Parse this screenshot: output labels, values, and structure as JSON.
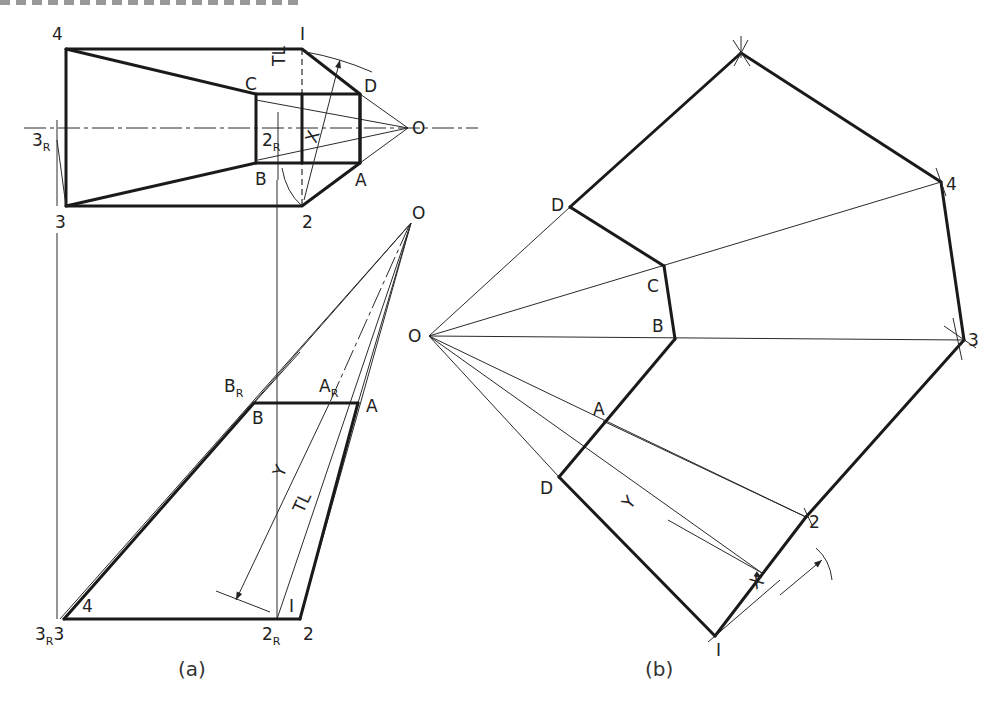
{
  "figure": {
    "title_strip": "",
    "panels": [
      {
        "id": "a",
        "caption": "(a)",
        "caption_pos": [
          178,
          676
        ]
      },
      {
        "id": "b",
        "caption": "(b)",
        "caption_pos": [
          645,
          676
        ]
      }
    ]
  },
  "panel_a": {
    "top_view": {
      "outer_heavy": [
        [
          66,
          49
        ],
        [
          302,
          49
        ],
        [
          360,
          94
        ],
        [
          360,
          163
        ],
        [
          302,
          206
        ],
        [
          66,
          206
        ],
        [
          66,
          49
        ]
      ],
      "inner_rect": [
        [
          256,
          94
        ],
        [
          360,
          94
        ],
        [
          360,
          163
        ],
        [
          256,
          163
        ],
        [
          256,
          94
        ]
      ],
      "slant_top": [
        [
          66,
          49
        ],
        [
          256,
          94
        ]
      ],
      "slant_bot": [
        [
          66,
          206
        ],
        [
          256,
          163
        ]
      ],
      "mid_vertical": [
        [
          302,
          94
        ],
        [
          302,
          163
        ]
      ],
      "centerline": [
        [
          24,
          128
        ],
        [
          478,
          128
        ]
      ],
      "hidden_1_2": [
        [
          302,
          49
        ],
        [
          302,
          206
        ]
      ],
      "rays_to_O": [
        [
          [
            360,
            94
          ],
          [
            408,
            128
          ]
        ],
        [
          [
            360,
            163
          ],
          [
            408,
            128
          ]
        ],
        [
          [
            256,
            100
          ],
          [
            408,
            128
          ]
        ],
        [
          [
            258,
            160
          ],
          [
            408,
            128
          ]
        ]
      ],
      "O": [
        408,
        128
      ],
      "labels": [
        {
          "t": "4",
          "x": 52,
          "y": 40
        },
        {
          "t": "I",
          "x": 300,
          "y": 40
        },
        {
          "t": "C",
          "x": 245,
          "y": 90
        },
        {
          "t": "D",
          "x": 364,
          "y": 92
        },
        {
          "t": "TL",
          "x": 285,
          "y": 66,
          "rot": -90
        },
        {
          "t": "X",
          "x": 316,
          "y": 144,
          "rot": -70
        },
        {
          "t": "O",
          "x": 412,
          "y": 134
        },
        {
          "t": "3",
          "x": 32,
          "y": 146,
          "sub": "R"
        },
        {
          "t": "2",
          "x": 262,
          "y": 146,
          "sub": "R"
        },
        {
          "t": "B",
          "x": 255,
          "y": 185
        },
        {
          "t": "A",
          "x": 355,
          "y": 186
        },
        {
          "t": "3",
          "x": 55,
          "y": 228
        },
        {
          "t": "2",
          "x": 302,
          "y": 228
        }
      ]
    },
    "front_view": {
      "O": [
        411,
        223
      ],
      "base_line": [
        [
          64,
          619
        ],
        [
          300,
          619
        ]
      ],
      "top_edge": [
        [
          254,
          403
        ],
        [
          358,
          403
        ]
      ],
      "left_heavy": [
        [
          64,
          619
        ],
        [
          254,
          403
        ]
      ],
      "right_heavy": [
        [
          300,
          619
        ],
        [
          358,
          403
        ]
      ],
      "projectors": [
        [
          [
            57,
            233
          ],
          [
            57,
            619
          ]
        ],
        [
          [
            277,
            180
          ],
          [
            277,
            619
          ]
        ]
      ],
      "rays_from_O": [
        [
          [
            411,
            223
          ],
          [
            60,
            619
          ]
        ],
        [
          [
            411,
            223
          ],
          [
            64,
            619
          ]
        ],
        [
          [
            411,
            223
          ],
          [
            277,
            619
          ]
        ],
        [
          [
            411,
            223
          ],
          [
            300,
            619
          ]
        ],
        [
          [
            411,
            223
          ],
          [
            358,
            403
          ]
        ]
      ],
      "tl_dashed": [
        [
          411,
          223
        ],
        [
          277,
          619
        ]
      ],
      "y_dim": {
        "from": [
          330,
          402
        ],
        "to": [
          236,
          600
        ],
        "tick": [
          [
            216,
            591
          ],
          [
            270,
            612
          ]
        ]
      },
      "labels": [
        {
          "t": "O",
          "x": 412,
          "y": 219
        },
        {
          "t": "B",
          "x": 224,
          "y": 392,
          "sub": "R"
        },
        {
          "t": "B",
          "x": 252,
          "y": 424
        },
        {
          "t": "A",
          "x": 319,
          "y": 392,
          "sub": "R"
        },
        {
          "t": "A",
          "x": 366,
          "y": 412
        },
        {
          "t": "Y",
          "x": 283,
          "y": 478,
          "rot": -65
        },
        {
          "t": "TL",
          "x": 303,
          "y": 514,
          "rot": -65
        },
        {
          "t": "4",
          "x": 82,
          "y": 612
        },
        {
          "t": "I",
          "x": 289,
          "y": 612
        },
        {
          "t": "3",
          "x": 35,
          "y": 640,
          "sub": "R",
          "after": "3"
        },
        {
          "t": "2",
          "x": 262,
          "y": 640,
          "sub": "R"
        },
        {
          "t": "2",
          "x": 303,
          "y": 640
        }
      ]
    }
  },
  "panel_b": {
    "O": [
      429,
      336
    ],
    "development_heavy": [
      [
        [
          570,
          207
        ],
        [
          741,
          53
        ]
      ],
      [
        [
          741,
          53
        ],
        [
          941,
          182
        ]
      ],
      [
        [
          941,
          182
        ],
        [
          964,
          340
        ]
      ],
      [
        [
          964,
          340
        ],
        [
          806,
          517
        ]
      ],
      [
        [
          806,
          517
        ],
        [
          715,
          636
        ]
      ],
      [
        [
          715,
          636
        ],
        [
          559,
          477
        ]
      ],
      [
        [
          559,
          477
        ],
        [
          675,
          339
        ]
      ],
      [
        [
          675,
          339
        ],
        [
          664,
          266
        ]
      ],
      [
        [
          664,
          266
        ],
        [
          570,
          207
        ]
      ]
    ],
    "thin_lines": [
      [
        [
          429,
          336
        ],
        [
          570,
          207
        ]
      ],
      [
        [
          429,
          336
        ],
        [
          941,
          182
        ]
      ],
      [
        [
          429,
          336
        ],
        [
          964,
          340
        ]
      ],
      [
        [
          429,
          336
        ],
        [
          806,
          517
        ]
      ],
      [
        [
          429,
          336
        ],
        [
          559,
          477
        ]
      ],
      [
        [
          429,
          336
        ],
        [
          762,
          573
        ]
      ],
      [
        [
          603,
          421
        ],
        [
          806,
          517
        ]
      ],
      [
        [
          715,
          636
        ],
        [
          806,
          517
        ]
      ],
      [
        [
          715,
          636
        ],
        [
          780,
          580
        ]
      ]
    ],
    "arc_marks": [
      [
        [
          733,
          40
        ],
        [
          750,
          66
        ]
      ],
      [
        [
          748,
          40
        ],
        [
          734,
          66
        ]
      ],
      [
        [
          741,
          36
        ],
        [
          741,
          58
        ]
      ],
      [
        [
          936,
          168
        ],
        [
          946,
          196
        ]
      ],
      [
        [
          953,
          318
        ],
        [
          962,
          360
        ]
      ],
      [
        [
          944,
          326
        ],
        [
          976,
          348
        ]
      ],
      [
        [
          804,
          508
        ],
        [
          812,
          525
        ]
      ],
      [
        [
          708,
          642
        ],
        [
          722,
          630
        ]
      ]
    ],
    "x_dim": {
      "from": [
        780,
        595
      ],
      "to": [
        822,
        560
      ],
      "arc": [
        [
          816,
          548
        ],
        [
          832,
          580
        ]
      ]
    },
    "labels": [
      {
        "t": "D",
        "x": 551,
        "y": 211
      },
      {
        "t": "4",
        "x": 946,
        "y": 190
      },
      {
        "t": "C",
        "x": 647,
        "y": 292
      },
      {
        "t": "B",
        "x": 652,
        "y": 332
      },
      {
        "t": "3",
        "x": 968,
        "y": 346
      },
      {
        "t": "O",
        "x": 408,
        "y": 342
      },
      {
        "t": "A",
        "x": 593,
        "y": 415
      },
      {
        "t": "D",
        "x": 540,
        "y": 494
      },
      {
        "t": "Y",
        "x": 630,
        "y": 510,
        "rot": -50
      },
      {
        "t": "2",
        "x": 809,
        "y": 528
      },
      {
        "t": "X",
        "x": 756,
        "y": 590,
        "rot": -40
      },
      {
        "t": "I",
        "x": 716,
        "y": 656
      }
    ]
  }
}
